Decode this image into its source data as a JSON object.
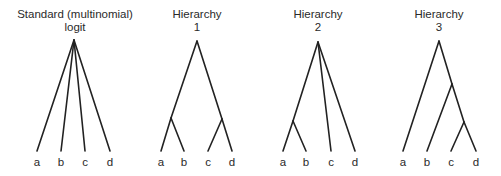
{
  "diagram": {
    "panels": [
      {
        "id": "standard-logit",
        "title_line1": "Standard (multinomial)",
        "title_line2": "logit",
        "center_x": 75,
        "leaves": [
          "a",
          "b",
          "c",
          "d"
        ],
        "leaf_x": [
          37,
          61,
          85,
          110
        ],
        "nodes": [
          {
            "id": "root",
            "x": 74,
            "y": 40
          }
        ],
        "edges": [
          [
            "root",
            "a"
          ],
          [
            "root",
            "b"
          ],
          [
            "root",
            "c"
          ],
          [
            "root",
            "d"
          ]
        ]
      },
      {
        "id": "hierarchy-1",
        "title_line1": "Hierarchy",
        "title_line2": "1",
        "center_x": 197,
        "leaves": [
          "a",
          "b",
          "c",
          "d"
        ],
        "leaf_x": [
          161,
          184,
          208,
          232
        ],
        "nodes": [
          {
            "id": "root",
            "x": 197,
            "y": 41
          },
          {
            "id": "ab",
            "x": 171,
            "y": 118
          },
          {
            "id": "cd",
            "x": 222,
            "y": 119
          }
        ],
        "edges": [
          [
            "root",
            "ab"
          ],
          [
            "root",
            "cd"
          ],
          [
            "ab",
            "a"
          ],
          [
            "ab",
            "b"
          ],
          [
            "cd",
            "c"
          ],
          [
            "cd",
            "d"
          ]
        ]
      },
      {
        "id": "hierarchy-2",
        "title_line1": "Hierarchy",
        "title_line2": "2",
        "center_x": 318,
        "leaves": [
          "a",
          "b",
          "c",
          "d"
        ],
        "leaf_x": [
          283,
          306,
          331,
          355
        ],
        "nodes": [
          {
            "id": "root",
            "x": 318,
            "y": 42
          },
          {
            "id": "ab",
            "x": 293,
            "y": 121
          }
        ],
        "edges": [
          [
            "root",
            "ab"
          ],
          [
            "root",
            "c"
          ],
          [
            "root",
            "d"
          ],
          [
            "ab",
            "a"
          ],
          [
            "ab",
            "b"
          ]
        ]
      },
      {
        "id": "hierarchy-3",
        "title_line1": "Hierarchy",
        "title_line2": "3",
        "center_x": 439,
        "leaves": [
          "a",
          "b",
          "c",
          "d"
        ],
        "leaf_x": [
          403,
          427,
          451,
          476
        ],
        "nodes": [
          {
            "id": "root",
            "x": 439,
            "y": 41
          },
          {
            "id": "bcd",
            "x": 452,
            "y": 84
          },
          {
            "id": "cd",
            "x": 464,
            "y": 122
          }
        ],
        "edges": [
          [
            "root",
            "a"
          ],
          [
            "root",
            "bcd"
          ],
          [
            "bcd",
            "b"
          ],
          [
            "bcd",
            "cd"
          ],
          [
            "cd",
            "c"
          ],
          [
            "cd",
            "d"
          ]
        ]
      }
    ],
    "leaf_y": 151,
    "label_y": 166,
    "title_y1": 18,
    "title_y2": 31,
    "line_color": "#222222"
  }
}
